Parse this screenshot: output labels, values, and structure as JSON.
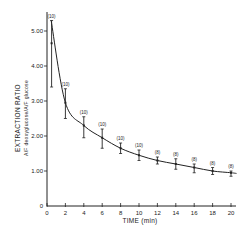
{
  "chart_data": {
    "type": "line",
    "title": "",
    "xlabel": "TIME (min)",
    "ylabel_line1": "EXTRACTION RATIO",
    "ylabel_line2": "A/F deoxyglucose/A/F glucose",
    "xlim": [
      0,
      20
    ],
    "ylim": [
      0,
      5.5
    ],
    "x_ticks": [
      0,
      2,
      4,
      6,
      8,
      10,
      12,
      14,
      16,
      18,
      20
    ],
    "y_ticks": [
      "0",
      "1.00",
      "2.00",
      "3.00",
      "4.00",
      "5.00"
    ],
    "grid": false,
    "legend": null,
    "series": [
      {
        "name": "Extraction ratio (mean ± SE)",
        "x": [
          0.5,
          2,
          4,
          6,
          8,
          10,
          12,
          14,
          16,
          18,
          20
        ],
        "values": [
          4.65,
          2.95,
          2.3,
          1.95,
          1.65,
          1.45,
          1.3,
          1.2,
          1.1,
          1.0,
          0.95
        ],
        "err_low": [
          3.4,
          2.5,
          1.95,
          1.65,
          1.5,
          1.3,
          1.2,
          1.05,
          0.95,
          0.9,
          0.85
        ],
        "err_high": [
          5.3,
          3.35,
          2.55,
          2.2,
          1.8,
          1.6,
          1.4,
          1.35,
          1.2,
          1.1,
          1.0
        ],
        "n_labels": [
          "(10)",
          "(10)",
          "(10)",
          "(10)",
          "(10)",
          "(10)",
          "(8)",
          "(8)",
          "(8)",
          "(8)",
          "(8)"
        ]
      }
    ],
    "fit_curve": "smooth decaying curve through means"
  },
  "colors": {
    "ink": "#222222",
    "background": "#ffffff"
  }
}
